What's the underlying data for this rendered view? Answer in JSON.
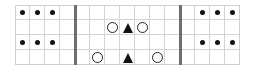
{
  "board": {
    "columns": 15,
    "rows": 4,
    "cell_size": 15,
    "origin": [
      15,
      5
    ],
    "dividers_after_column": [
      4,
      11
    ],
    "colors": {
      "grid": "#d4d4d4",
      "divider": "#6e6e6e",
      "piece": "#111111",
      "background": "#ffffff"
    }
  },
  "pieces": [
    {
      "type": "dot",
      "row": 0,
      "col": 0
    },
    {
      "type": "dot",
      "row": 0,
      "col": 1
    },
    {
      "type": "dot",
      "row": 0,
      "col": 2
    },
    {
      "type": "dot",
      "row": 2,
      "col": 0
    },
    {
      "type": "dot",
      "row": 2,
      "col": 1
    },
    {
      "type": "dot",
      "row": 2,
      "col": 2
    },
    {
      "type": "dot",
      "row": 0,
      "col": 12
    },
    {
      "type": "dot",
      "row": 0,
      "col": 13
    },
    {
      "type": "dot",
      "row": 0,
      "col": 14
    },
    {
      "type": "dot",
      "row": 2,
      "col": 12
    },
    {
      "type": "dot",
      "row": 2,
      "col": 13
    },
    {
      "type": "dot",
      "row": 2,
      "col": 14
    },
    {
      "type": "circle",
      "row": 1,
      "col": 6
    },
    {
      "type": "triangle",
      "row": 1,
      "col": 7
    },
    {
      "type": "circle",
      "row": 1,
      "col": 8
    },
    {
      "type": "circle",
      "row": 3,
      "col": 5
    },
    {
      "type": "triangle",
      "row": 3,
      "col": 7
    },
    {
      "type": "circle",
      "row": 3,
      "col": 9
    }
  ]
}
